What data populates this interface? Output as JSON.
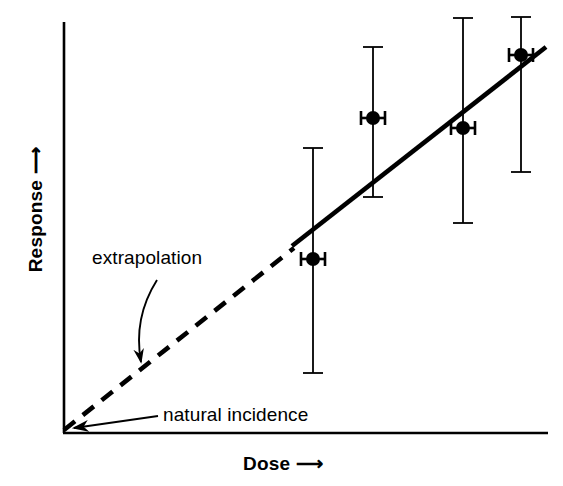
{
  "figure": {
    "background": "#ffffff",
    "ink_color": "#000000"
  },
  "axes": {
    "y_label": "Response",
    "y_label_arrow": "⟶",
    "x_label": "Dose",
    "x_label_arrow": "⟶",
    "origin": {
      "x": 63,
      "y": 433
    },
    "y_axis_top": {
      "x": 63,
      "y": 22
    },
    "x_axis_right": {
      "x": 548,
      "y": 433
    },
    "ticks": [],
    "tick_labels": []
  },
  "annotations": [
    {
      "name": "extrapolation",
      "text": "extrapolation",
      "text_x": 92,
      "text_y": 247,
      "arrow": {
        "type": "curved",
        "start_x": 157,
        "start_y": 280,
        "ctrl_x": 133,
        "ctrl_y": 318,
        "end_x": 141,
        "end_y": 366
      }
    },
    {
      "name": "natural-incidence",
      "text": "natural incidence",
      "text_x": 163,
      "text_y": 404,
      "arrow": {
        "type": "straight",
        "start_x": 158,
        "start_y": 416,
        "end_x": 68,
        "end_y": 429
      }
    }
  ],
  "chart_data": {
    "type": "scatter",
    "title": "",
    "xlabel": "Dose ⟶",
    "ylabel": "Response ⟶",
    "grid": false,
    "legend": null,
    "axis_units": "arbitrary (unlabelled axes, no tick marks)",
    "xlim_px": [
      63,
      548
    ],
    "ylim_px": [
      433,
      22
    ],
    "note": "Schematic dose-response figure: observed high-dose data points with error bars, a fitted solid line through the data, and a dashed linear extrapolation back to the origin / natural incidence.",
    "points": [
      {
        "label": "point-1",
        "x_px": 313,
        "y_px": 259,
        "x_err_px": 12,
        "y_err_low_px": 373,
        "y_err_high_px": 148
      },
      {
        "label": "point-2",
        "x_px": 373,
        "y_px": 118,
        "x_err_px": 12,
        "y_err_low_px": 197,
        "y_err_high_px": 47
      },
      {
        "label": "point-3",
        "x_px": 463,
        "y_px": 128,
        "x_err_px": 12,
        "y_err_low_px": 223,
        "y_err_high_px": 18
      },
      {
        "label": "point-4",
        "x_px": 521,
        "y_px": 55,
        "x_err_px": 12,
        "y_err_low_px": 172,
        "y_err_high_px": 17
      }
    ],
    "fit_line_solid": {
      "label": "fitted dose-response line",
      "x1_px": 292,
      "y1_px": 246,
      "x2_px": 546,
      "y2_px": 47,
      "style": "solid",
      "width_px": 4
    },
    "fit_line_dashed": {
      "label": "linear extrapolation to origin",
      "x1_px": 64,
      "y1_px": 430,
      "x2_px": 294,
      "y2_px": 248,
      "style": "dashed",
      "width_px": 4,
      "dash_pattern": "14 10"
    }
  }
}
